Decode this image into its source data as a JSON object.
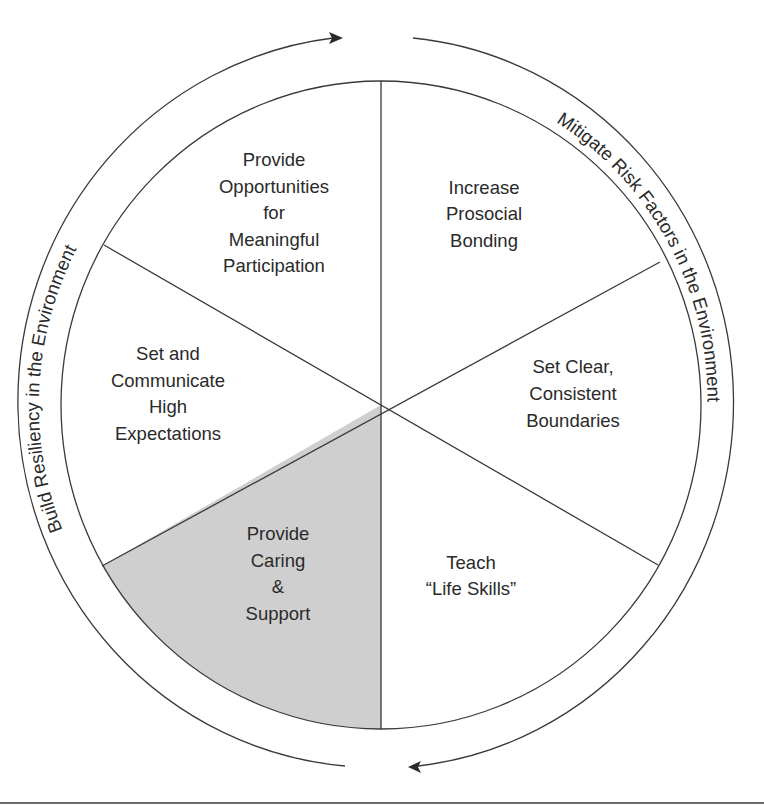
{
  "diagram": {
    "type": "wheel",
    "center": [
      381,
      405
    ],
    "radius": 322,
    "colors": {
      "line": "#3a3a3a",
      "highlight_fill": "#cfcfcf",
      "background": "#ffffff",
      "text": "#2a2a2a"
    },
    "segments": [
      {
        "id": "top-right",
        "lines": [
          "Increase",
          "Prosocial",
          "Bonding"
        ],
        "highlighted": false
      },
      {
        "id": "right",
        "lines": [
          "Set Clear,",
          "Consistent",
          "Boundaries"
        ],
        "highlighted": false
      },
      {
        "id": "bottom-right",
        "lines": [
          "Teach",
          "“Life Skills”"
        ],
        "highlighted": false
      },
      {
        "id": "bottom-left",
        "lines": [
          "Provide",
          "Caring",
          "&",
          "Support"
        ],
        "highlighted": true
      },
      {
        "id": "left",
        "lines": [
          "Set and",
          "Communicate",
          "High",
          "Expectations"
        ],
        "highlighted": false
      },
      {
        "id": "top-left",
        "lines": [
          "Provide",
          "Opportunities",
          "for",
          "Meaningful",
          "Participation"
        ],
        "highlighted": false
      }
    ],
    "ring_labels": {
      "left": "Build Resiliency in the Environment",
      "right": "Mitigate Risk Factors in the Environment"
    },
    "arrows": {
      "left": {
        "direction": "clockwise-up",
        "icon": "arrow-right-icon"
      },
      "right": {
        "direction": "clockwise-down",
        "icon": "arrow-left-icon"
      }
    }
  }
}
